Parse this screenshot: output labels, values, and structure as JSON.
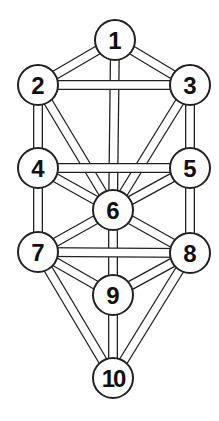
{
  "diagram": {
    "title": "",
    "nodes": [
      {
        "id": "1",
        "label": "1",
        "x": 115,
        "y": 40
      },
      {
        "id": "2",
        "label": "2",
        "x": 38,
        "y": 85
      },
      {
        "id": "3",
        "label": "3",
        "x": 190,
        "y": 85
      },
      {
        "id": "4",
        "label": "4",
        "x": 38,
        "y": 168
      },
      {
        "id": "5",
        "label": "5",
        "x": 190,
        "y": 168
      },
      {
        "id": "6",
        "label": "6",
        "x": 113,
        "y": 210
      },
      {
        "id": "7",
        "label": "7",
        "x": 38,
        "y": 252
      },
      {
        "id": "8",
        "label": "8",
        "x": 190,
        "y": 253
      },
      {
        "id": "9",
        "label": "9",
        "x": 113,
        "y": 295
      },
      {
        "id": "10",
        "label": "10",
        "x": 113,
        "y": 378
      }
    ],
    "edges": [
      [
        "1",
        "2"
      ],
      [
        "1",
        "3"
      ],
      [
        "1",
        "6"
      ],
      [
        "2",
        "3"
      ],
      [
        "2",
        "4"
      ],
      [
        "2",
        "6"
      ],
      [
        "3",
        "5"
      ],
      [
        "3",
        "6"
      ],
      [
        "4",
        "5"
      ],
      [
        "4",
        "6"
      ],
      [
        "4",
        "7"
      ],
      [
        "5",
        "6"
      ],
      [
        "5",
        "8"
      ],
      [
        "6",
        "7"
      ],
      [
        "6",
        "8"
      ],
      [
        "6",
        "9"
      ],
      [
        "7",
        "8"
      ],
      [
        "7",
        "9"
      ],
      [
        "7",
        "10"
      ],
      [
        "8",
        "9"
      ],
      [
        "8",
        "10"
      ],
      [
        "9",
        "10"
      ]
    ],
    "style": {
      "stroke": "#222222",
      "fill": "#ffffff",
      "node_radius": 20,
      "path_width": 10
    }
  }
}
